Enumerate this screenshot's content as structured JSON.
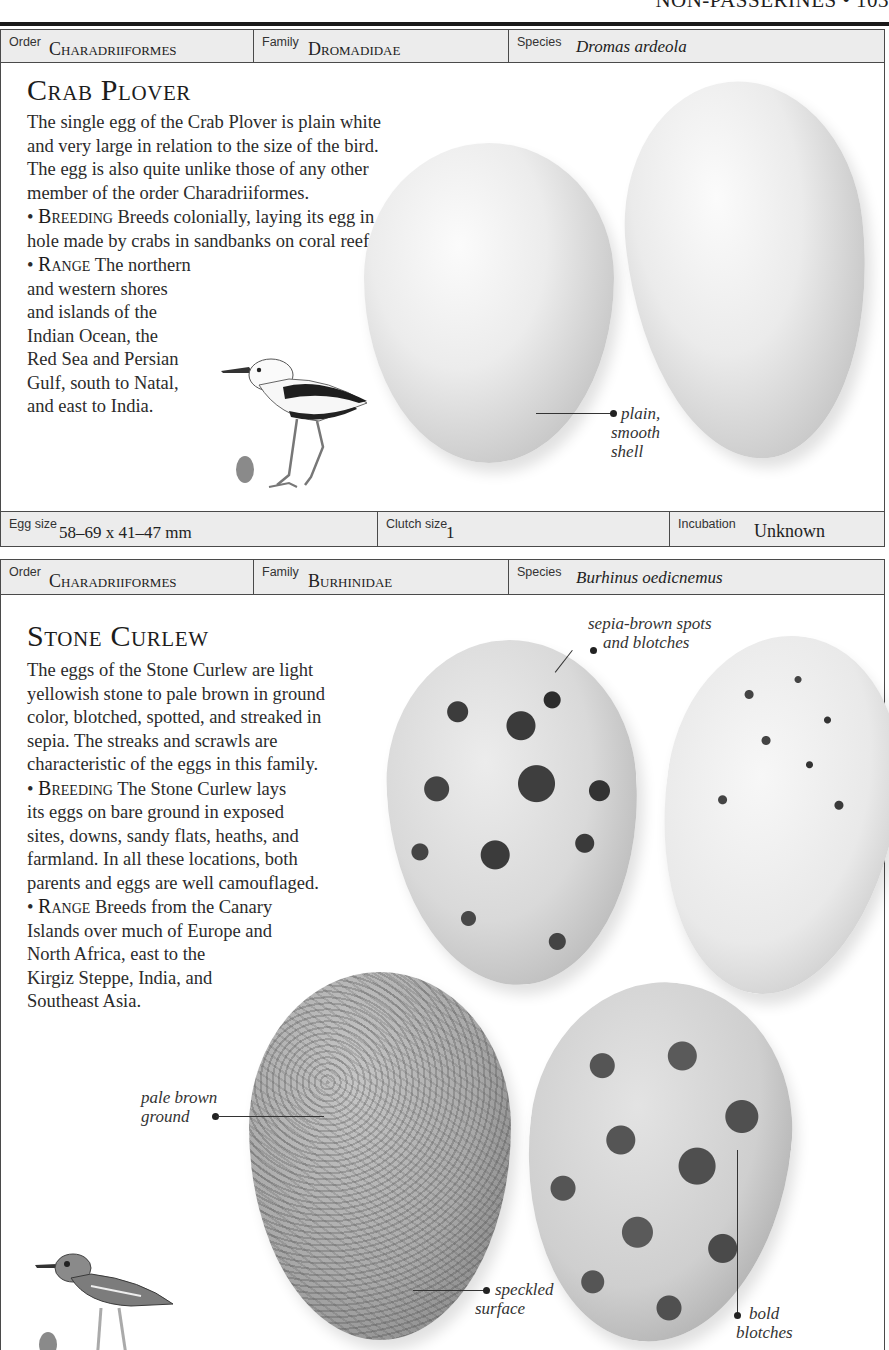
{
  "page": {
    "running_head": "NON-PASSERINES • 103"
  },
  "entries": [
    {
      "taxonomy": {
        "order_label": "Order",
        "order": "Charadriiformes",
        "family_label": "Family",
        "family": "Dromadidae",
        "species_label": "Species",
        "species": "Dromas ardeola"
      },
      "title": "Crab Plover",
      "description": "The single egg of the Crab Plover is plain white and very large in relation to the size of the bird. The egg is also quite unlike those of any other member of the order Charadriiformes.",
      "breeding_label": "Breeding",
      "breeding": "Breeds colonially, laying its egg in a hole made by crabs in sandbanks on coral reefs.",
      "range_label": "Range",
      "range_first": "The northern",
      "range_lines": [
        "and western shores",
        "and islands of the",
        "Indian Ocean, the",
        "Red Sea and Persian",
        "Gulf, south to Natal,",
        "and east to India."
      ],
      "callouts": [
        {
          "text": "• plain,\nsmooth\nshell"
        }
      ],
      "illustration": "crab-plover-bird-icon",
      "facts": {
        "egg_size_label": "Egg size",
        "egg_size": "58–69 x 41–47 mm",
        "clutch_label": "Clutch size",
        "clutch": "1",
        "incubation_label": "Incubation",
        "incubation": "Unknown"
      },
      "colors": {
        "egg": "#e8e8e8",
        "mini_egg": "#8a8a8a"
      }
    },
    {
      "taxonomy": {
        "order_label": "Order",
        "order": "Charadriiformes",
        "family_label": "Family",
        "family": "Burhinidae",
        "species_label": "Species",
        "species": "Burhinus oedicnemus"
      },
      "title": "Stone Curlew",
      "description_lines": [
        "The eggs of the Stone Curlew are light",
        "yellowish stone to pale brown in ground",
        "color, blotched, spotted, and streaked in",
        "sepia. The streaks and scrawls are",
        "characteristic of the eggs in this family."
      ],
      "breeding_label": "Breeding",
      "breeding_first": "The Stone Curlew lays",
      "breeding_lines": [
        "its eggs on bare ground in exposed",
        "sites, downs, sandy flats, heaths, and",
        "farmland. In all these locations, both",
        "parents and eggs are well camouflaged."
      ],
      "range_label": "Range",
      "range_first": "Breeds from the Canary",
      "range_lines": [
        "Islands over much of Europe and",
        "North Africa, east to the",
        "Kirgiz Steppe, India, and",
        "Southeast Asia."
      ],
      "callouts": [
        {
          "line1": "sepia-brown spots",
          "line2": "and blotches"
        },
        {
          "line1": "pale brown",
          "line2": "ground"
        },
        {
          "line1": "speckled",
          "line2": "surface"
        },
        {
          "line1": "bold",
          "line2": "blotches"
        }
      ],
      "illustration": "stone-curlew-bird-icon"
    }
  ]
}
